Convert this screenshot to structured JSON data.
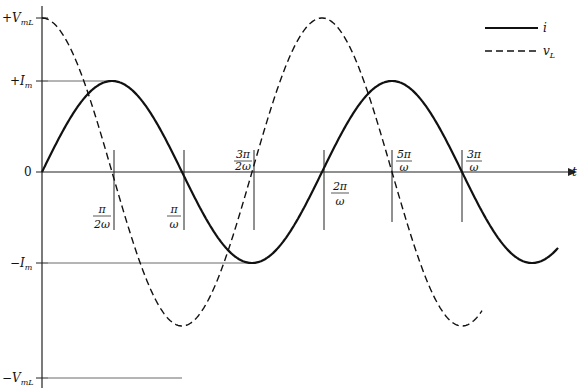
{
  "diagram": {
    "axes": {
      "x_label": "t",
      "origin_label": "0",
      "y_ticks": [
        {
          "label": "+V",
          "sub": "mL",
          "level": "v_max"
        },
        {
          "label": "+I",
          "sub": "m",
          "level": "i_max"
        },
        {
          "label": "−I",
          "sub": "m",
          "level": "i_min"
        },
        {
          "label": "−V",
          "sub": "mL",
          "level": "v_min"
        }
      ],
      "x_ticks": [
        {
          "num": "π",
          "den": "2ω",
          "position": "below"
        },
        {
          "num": "π",
          "den": "ω",
          "position": "below"
        },
        {
          "num": "3π",
          "den": "2ω",
          "position": "above"
        },
        {
          "num": "2π",
          "den": "ω",
          "position": "below"
        },
        {
          "num": "5π",
          "den": "ω",
          "position": "above"
        },
        {
          "num": "3π",
          "den": "ω",
          "position": "above"
        }
      ]
    },
    "legend": [
      {
        "label": "i",
        "style": "solid"
      },
      {
        "label": "v",
        "sub": "L",
        "style": "dashed"
      }
    ],
    "series": [
      {
        "name": "i",
        "function": "I_m sin(ωt)",
        "style": "solid"
      },
      {
        "name": "v_L",
        "function": "V_mL cos(ωt)",
        "style": "dashed"
      }
    ],
    "colors": {
      "stroke": "#111111",
      "guide": "#333333"
    }
  }
}
